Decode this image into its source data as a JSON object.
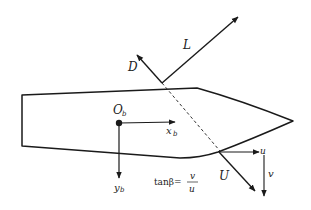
{
  "diagram": {
    "type": "ship-hydrodynamics-free-body",
    "colors": {
      "stroke": "#1a1a1a",
      "background": "#ffffff"
    },
    "labels": {
      "lift": "L",
      "drag": "D",
      "origin": "O",
      "origin_sub": "b",
      "x_axis": "x",
      "x_axis_sub": "b",
      "y_axis": "y",
      "y_axis_sub": "b",
      "velocity": "U",
      "u_component": "u",
      "v_component": "v",
      "equation_lhs": "tanβ=",
      "equation_num": "v",
      "equation_den": "u"
    },
    "elements": [
      {
        "id": "hull",
        "kind": "outline",
        "description": "ship hull, bow pointing right"
      },
      {
        "id": "lift-vector",
        "kind": "arrow",
        "label": "L"
      },
      {
        "id": "drag-vector",
        "kind": "arrow",
        "label": "D"
      },
      {
        "id": "centerline-dashed",
        "kind": "dashed-line"
      },
      {
        "id": "body-x-axis",
        "kind": "arrow",
        "label": "x_b"
      },
      {
        "id": "body-y-axis",
        "kind": "arrow",
        "label": "y_b"
      },
      {
        "id": "velocity-vector",
        "kind": "arrow",
        "label": "U"
      },
      {
        "id": "u-component",
        "kind": "arrow",
        "label": "u"
      },
      {
        "id": "v-component",
        "kind": "arrow",
        "label": "v"
      }
    ]
  }
}
